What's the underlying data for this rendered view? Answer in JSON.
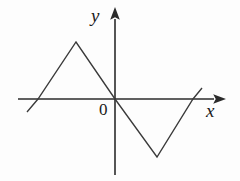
{
  "figure": {
    "title": "",
    "background_color": "#fdfdfd",
    "stroke_color": "#3a3a3a",
    "axis_color": "#2b2b2b"
  },
  "labels": {
    "y_axis": "y",
    "x_axis": "x",
    "origin": "0"
  },
  "chart_data": {
    "type": "line",
    "title": "",
    "xlabel": "x",
    "ylabel": "y",
    "grid": false,
    "legend": null,
    "axes": {
      "x_axis_y_pixel": 99,
      "y_axis_x_pixel": 115,
      "x_axis_start_pixel": 18,
      "x_axis_arrow_tip_pixel": 222,
      "y_axis_arrow_tip_pixel": 11,
      "y_axis_end_pixel": 175,
      "origin_pixel": [
        115,
        99
      ]
    },
    "x": [
      -4.0,
      -3.2,
      -2.0,
      0.0,
      2.0,
      3.2,
      3.6
    ],
    "y": [
      -0.55,
      0.0,
      2.85,
      0.0,
      -2.85,
      0.0,
      0.55
    ],
    "points_pixel": [
      [
        27,
        112
      ],
      [
        38,
        99
      ],
      [
        76,
        42
      ],
      [
        115,
        99
      ],
      [
        157,
        157
      ],
      [
        193,
        99
      ],
      [
        202,
        88
      ]
    ],
    "vertices": [
      {
        "name": "left-endpoint",
        "x": -4.0,
        "y": -0.55
      },
      {
        "name": "left-x-intercept",
        "x": -3.2,
        "y": 0.0
      },
      {
        "name": "peak",
        "x": -2.0,
        "y": 2.85
      },
      {
        "name": "origin-crossing",
        "x": 0.0,
        "y": 0.0
      },
      {
        "name": "trough",
        "x": 2.0,
        "y": -2.85
      },
      {
        "name": "right-x-intercept",
        "x": 3.2,
        "y": 0.0
      },
      {
        "name": "right-endpoint",
        "x": 3.6,
        "y": 0.55
      }
    ],
    "xlim": [
      -4.6,
      4.2
    ],
    "ylim": [
      -3.2,
      3.6
    ]
  }
}
